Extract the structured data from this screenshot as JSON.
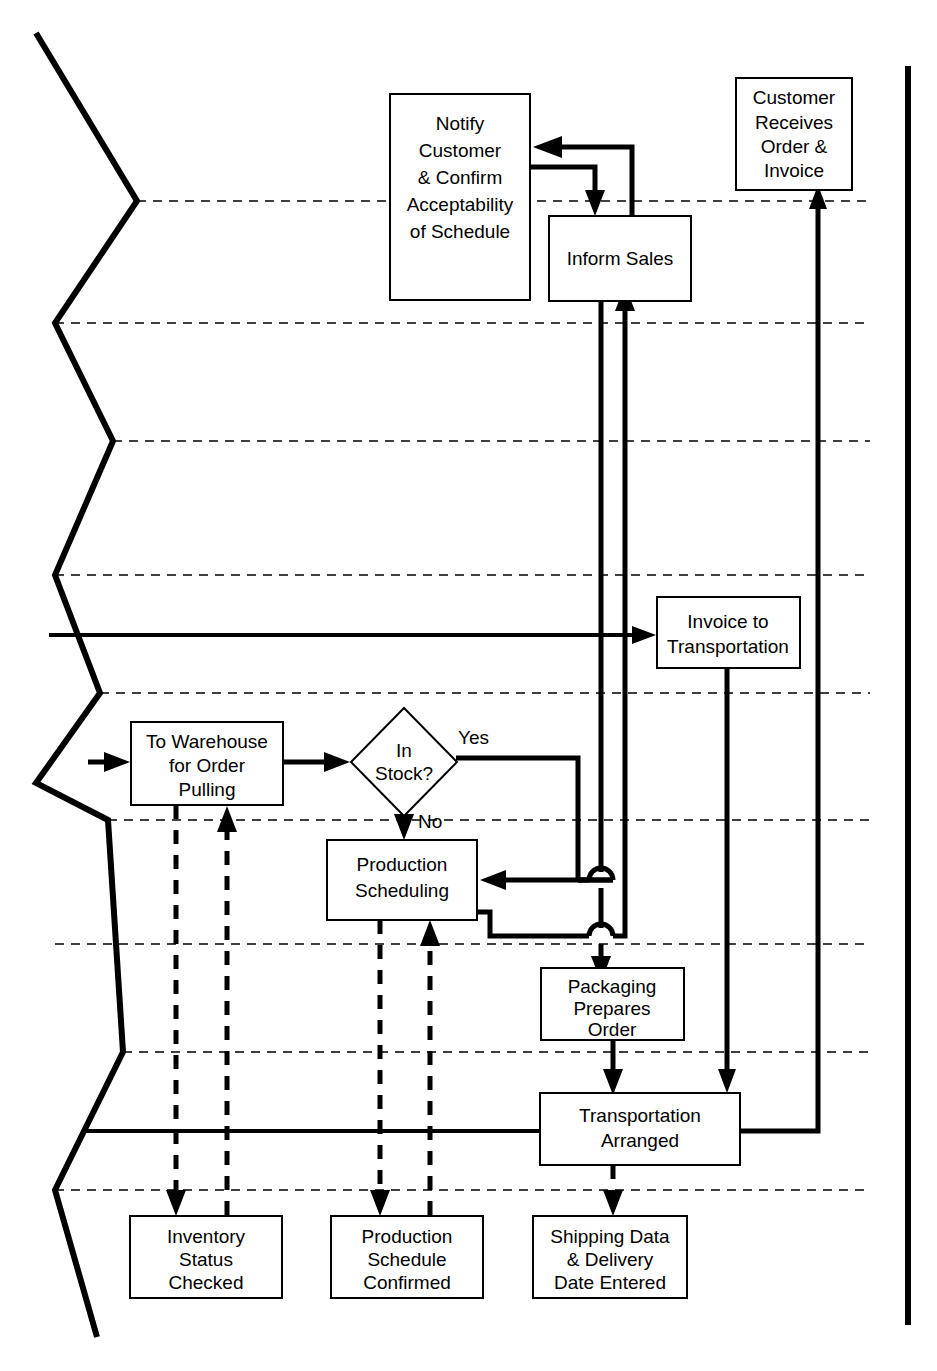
{
  "diagram": {
    "type": "cross-functional-flowchart",
    "colors": {
      "line": "#000000",
      "box_fill": "#ffffff",
      "background": "#ffffff"
    }
  },
  "nodes": {
    "notify_customer": {
      "id": "notify-customer-confirm-acceptability",
      "shape": "process",
      "lines": [
        "Notify",
        "Customer",
        "& Confirm",
        "Acceptability",
        "of Schedule"
      ]
    },
    "inform_sales": {
      "id": "inform-sales",
      "shape": "process",
      "lines": [
        "Inform Sales"
      ]
    },
    "customer_receives": {
      "id": "customer-receives-order-invoice",
      "shape": "process",
      "lines": [
        "Customer",
        "Receives",
        "Order &",
        "Invoice"
      ]
    },
    "invoice_to_transportation": {
      "id": "invoice-to-transportation",
      "shape": "process",
      "lines": [
        "Invoice to",
        "Transportation"
      ]
    },
    "to_warehouse": {
      "id": "to-warehouse-for-order-pulling",
      "shape": "process",
      "lines": [
        "To Warehouse",
        "for Order",
        "Pulling"
      ]
    },
    "in_stock": {
      "id": "in-stock-decision",
      "shape": "decision",
      "lines": [
        "In",
        "Stock?"
      ]
    },
    "production_scheduling": {
      "id": "production-scheduling",
      "shape": "process",
      "lines": [
        "Production",
        "Scheduling"
      ]
    },
    "packaging": {
      "id": "packaging-prepares-order",
      "shape": "process",
      "lines": [
        "Packaging",
        "Prepares",
        "Order"
      ]
    },
    "transportation_arranged": {
      "id": "transportation-arranged",
      "shape": "process",
      "lines": [
        "Transportation",
        "Arranged"
      ]
    },
    "inventory_status": {
      "id": "inventory-status-checked",
      "shape": "data",
      "lines": [
        "Inventory",
        "Status",
        "Checked"
      ]
    },
    "production_schedule_confirmed": {
      "id": "production-schedule-confirmed",
      "shape": "data",
      "lines": [
        "Production",
        "Schedule",
        "Confirmed"
      ]
    },
    "shipping_data": {
      "id": "shipping-data-delivery-date-entered",
      "shape": "data",
      "lines": [
        "Shipping Data",
        "& Delivery",
        "Date Entered"
      ]
    }
  },
  "edge_labels": {
    "yes": "Yes",
    "no": "No"
  }
}
